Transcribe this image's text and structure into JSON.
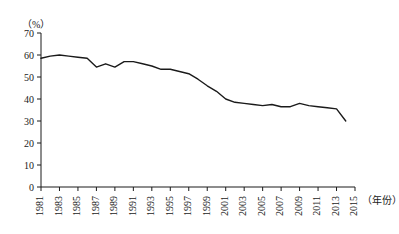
{
  "chart_data": {
    "type": "line",
    "title": "",
    "xlabel": "（年份）",
    "ylabel": "（%）",
    "ylim": [
      0,
      70
    ],
    "ytick_step": 10,
    "yticks": [
      0,
      10,
      20,
      30,
      40,
      50,
      60,
      70
    ],
    "xlim": [
      1981,
      2015
    ],
    "xtick_labels": [
      "1981",
      "1983",
      "1985",
      "1987",
      "1989",
      "1991",
      "1993",
      "1995",
      "1997",
      "1999",
      "2001",
      "2003",
      "2005",
      "2007",
      "2009",
      "2011",
      "2013",
      "2015"
    ],
    "xtick_values": [
      1981,
      1983,
      1985,
      1987,
      1989,
      1991,
      1993,
      1995,
      1997,
      1999,
      2001,
      2003,
      2005,
      2007,
      2009,
      2011,
      2013,
      2015
    ],
    "grid": false,
    "legend": "none",
    "line_color": "#1a1a1a",
    "x": [
      1981,
      1982,
      1983,
      1984,
      1985,
      1986,
      1987,
      1988,
      1989,
      1990,
      1991,
      1992,
      1993,
      1994,
      1995,
      1996,
      1997,
      1998,
      1999,
      2000,
      2001,
      2002,
      2003,
      2004,
      2005,
      2006,
      2007,
      2008,
      2009,
      2010,
      2011,
      2012,
      2013,
      2014
    ],
    "series": [
      {
        "name": "比重",
        "values": [
          58.5,
          59.5,
          60.0,
          59.5,
          59.0,
          58.5,
          54.5,
          56.0,
          54.5,
          57.0,
          57.0,
          56.0,
          55.0,
          53.5,
          53.5,
          52.5,
          51.5,
          49.0,
          46.0,
          43.5,
          40.0,
          38.5,
          38.0,
          37.5,
          37.0,
          37.5,
          36.5,
          36.5,
          38.0,
          37.0,
          36.5,
          36.0,
          35.5,
          30.0
        ]
      }
    ]
  }
}
